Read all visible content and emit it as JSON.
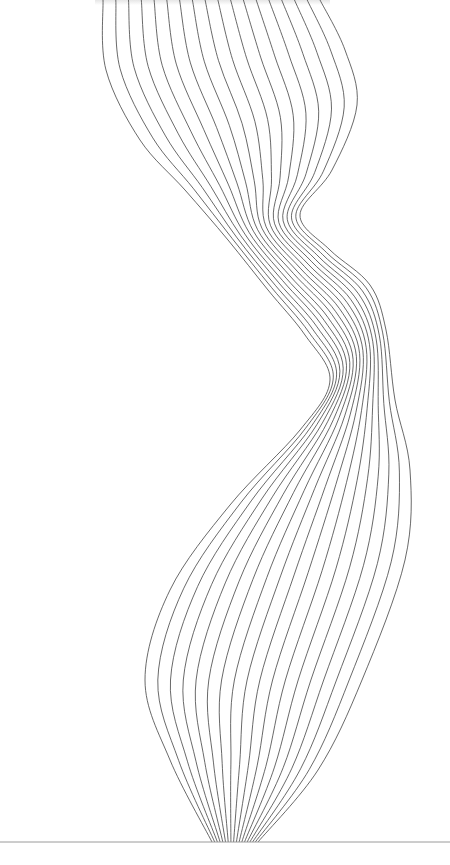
{
  "artwork": {
    "description": "Abstract twisted ribbon of parallel wavy lines",
    "line_count": 18,
    "line_color": "#3a3a3a",
    "background_color": "#ffffff",
    "baseline_color": "#9a9a9a"
  }
}
